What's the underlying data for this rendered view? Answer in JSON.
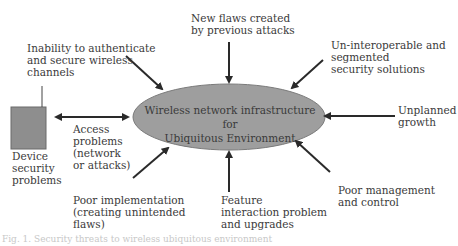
{
  "diagram": {
    "center": {
      "line1": "Wireless network infrastructure for",
      "line2": "Ubiquitous Environment",
      "fill": "#9e9e9e"
    },
    "labels": {
      "new_flaws": "New flaws created\nby previous attacks",
      "inability": "Inability to authenticate\nand secure wireless\nchannels",
      "uninteroperable": "Un-interoperable and\nsegmented\nsecurity solutions",
      "unplanned": "Unplanned\ngrowth",
      "access": "Access\nproblems\n(network\nor attacks)",
      "device": "Device\nsecurity\nproblems",
      "poor_impl": "Poor implementation\n(creating unintended\nflaws)",
      "feature": "Feature\ninteraction problem\nand upgrades",
      "poor_mgmt": "Poor management\nand control"
    },
    "device_box_color": "#8e8e8e",
    "arrow_color": "#2a2a2a",
    "caption": "Fig. 1. Security threats to wireless ubiquitous environment"
  }
}
